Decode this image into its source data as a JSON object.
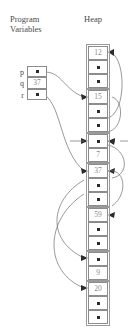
{
  "headings": {
    "program_variables_line1": "Program",
    "program_variables_line2": "Variables",
    "heap": "Heap"
  },
  "program_variables": {
    "frame": {
      "x": 27,
      "y": 66,
      "w": 20,
      "h": 34
    },
    "rows": [
      {
        "name": "p",
        "kind": "pointer",
        "value": "",
        "target_block": 1,
        "target_cell": 0
      },
      {
        "name": "q",
        "kind": "value",
        "value": "37"
      },
      {
        "name": "r",
        "kind": "pointer",
        "value": "",
        "target_block": 3,
        "target_cell": 0
      }
    ]
  },
  "heap": {
    "column_x": 88,
    "cell_w": 20,
    "cell_h": 14,
    "blocks": [
      {
        "id": 0,
        "y": 46,
        "cells": [
          {
            "kind": "value",
            "value": "12"
          },
          {
            "kind": "pointer",
            "value": ""
          },
          {
            "kind": "pointer",
            "value": ""
          }
        ]
      },
      {
        "id": 1,
        "y": 90,
        "cells": [
          {
            "kind": "value",
            "value": "15"
          },
          {
            "kind": "pointer",
            "value": ""
          },
          {
            "kind": "pointer",
            "value": ""
          }
        ]
      },
      {
        "id": 2,
        "y": 134,
        "cells": [
          {
            "kind": "pointer",
            "value": ""
          },
          {
            "kind": "value",
            "value": "7"
          }
        ]
      },
      {
        "id": 3,
        "y": 164,
        "cells": [
          {
            "kind": "value",
            "value": "37"
          },
          {
            "kind": "pointer",
            "value": ""
          },
          {
            "kind": "pointer",
            "value": ""
          }
        ]
      },
      {
        "id": 4,
        "y": 208,
        "cells": [
          {
            "kind": "value",
            "value": "59"
          },
          {
            "kind": "pointer",
            "value": ""
          },
          {
            "kind": "pointer",
            "value": ""
          }
        ]
      },
      {
        "id": 5,
        "y": 252,
        "cells": [
          {
            "kind": "pointer",
            "value": ""
          },
          {
            "kind": "value",
            "value": "9"
          }
        ]
      },
      {
        "id": 6,
        "y": 282,
        "cells": [
          {
            "kind": "value",
            "value": "20"
          },
          {
            "kind": "pointer",
            "value": ""
          },
          {
            "kind": "pointer",
            "value": ""
          }
        ]
      }
    ]
  },
  "colors": {
    "box_border": "#8c8c8c",
    "dot": "#2b2b2b",
    "wire": "#6d6d6d",
    "value_text": "#8a8a8a",
    "label_text": "#4a4a4a",
    "background": "#ffffff"
  }
}
